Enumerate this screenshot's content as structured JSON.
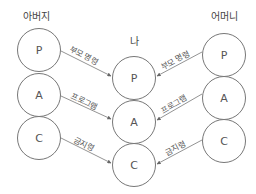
{
  "columns": {
    "father": {
      "label": "아버지",
      "nodes": [
        "P",
        "A",
        "C"
      ]
    },
    "self": {
      "label": "나",
      "nodes": [
        "P",
        "A",
        "C"
      ]
    },
    "mother": {
      "label": "어머니",
      "nodes": [
        "P",
        "A",
        "C"
      ]
    }
  },
  "edges": {
    "father": [
      "부모 명령",
      "프로그램",
      "금지령"
    ],
    "mother": [
      "부모 명령",
      "프로그램",
      "금지령"
    ]
  },
  "colors": {
    "stroke": "#777777",
    "text": "#555555",
    "background": "#ffffff"
  }
}
